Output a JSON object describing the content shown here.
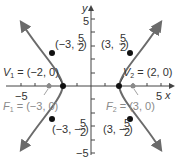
{
  "diagram": {
    "type": "hyperbola-graph",
    "equation_params": {
      "a": 2,
      "c": 3,
      "b_squared": 5
    },
    "axes": {
      "x_label": "x",
      "y_label": "y",
      "x_tick_labels": {
        "neg": "−5",
        "pos": "5"
      },
      "y_tick_labels": {
        "pos": "5",
        "neg": "−5"
      }
    },
    "vertices": [
      {
        "label_name": "V",
        "sub": "1",
        "text": " = (−2, 0)",
        "x": -2,
        "y": 0
      },
      {
        "label_name": "V",
        "sub": "2",
        "text": " = (2, 0)",
        "x": 2,
        "y": 0
      }
    ],
    "foci": [
      {
        "label_name": "F",
        "sub": "1",
        "text": " = (−3, 0)",
        "x": -3,
        "y": 0
      },
      {
        "label_name": "F",
        "sub": "2",
        "text": " = (3, 0)",
        "x": 3,
        "y": 0
      }
    ],
    "points": [
      {
        "prefix": "(−3, ",
        "num": "5",
        "den": "2",
        "suffix": ")",
        "x": -3,
        "y": 2.5
      },
      {
        "prefix": "(3, ",
        "num": "5",
        "den": "2",
        "suffix": ")",
        "x": 3,
        "y": 2.5
      },
      {
        "prefix": "(−3, −",
        "num": "5",
        "den": "2",
        "suffix": ")",
        "x": -3,
        "y": -2.5
      },
      {
        "prefix": "(3, −",
        "num": "5",
        "den": "2",
        "suffix": ")",
        "x": 3,
        "y": -2.5
      }
    ],
    "colors": {
      "curve": "#6b6b6b",
      "axis": "#444444",
      "focus": "#8a8a8a",
      "point": "#111111"
    }
  }
}
